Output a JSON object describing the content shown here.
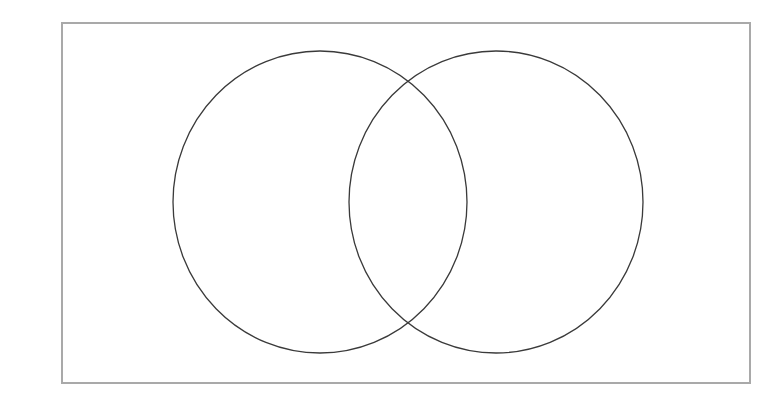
{
  "page": {
    "title": "Two-Circle Venn Diagram",
    "background_color": "#ffffff",
    "width": 763,
    "height": 415
  },
  "frame": {
    "name": "universal-set-rectangle",
    "label": "",
    "x": 62,
    "y": 23,
    "width": 688,
    "height": 360,
    "stroke_color": "#a9a9a9",
    "stroke_width": 1.6,
    "fill_color": "#ffffff"
  },
  "chart_data": {
    "type": "diagram",
    "diagram_type": "venn",
    "title": "",
    "subtitle": "",
    "set_count": 2,
    "labels_shown": false,
    "region_counts_shown": false,
    "grid": false,
    "legend": null,
    "annotations": [],
    "stroke_color": "#3a3a3a",
    "stroke_width": 1.3,
    "fill_color": "none",
    "universe": {
      "shape": "rectangle",
      "label": "",
      "x": 62,
      "y": 23,
      "width": 688,
      "height": 360
    },
    "sets": [
      {
        "id": "A",
        "label": "",
        "shape": "ellipse",
        "cx": 320,
        "cy": 202,
        "rx": 147,
        "ry": 151,
        "stroke_color": "#3a3a3a",
        "fill_color": "none"
      },
      {
        "id": "B",
        "label": "",
        "shape": "ellipse",
        "cx": 496,
        "cy": 202,
        "rx": 147,
        "ry": 151,
        "stroke_color": "#3a3a3a",
        "fill_color": "none"
      }
    ],
    "intersection_points": [
      {
        "x": 405,
        "y": 82
      },
      {
        "x": 405,
        "y": 322
      }
    ],
    "regions": [
      {
        "id": "A_only",
        "label": "",
        "count": null
      },
      {
        "id": "A_and_B",
        "label": "",
        "count": null
      },
      {
        "id": "B_only",
        "label": "",
        "count": null
      },
      {
        "id": "outside",
        "label": "",
        "count": null
      }
    ]
  }
}
